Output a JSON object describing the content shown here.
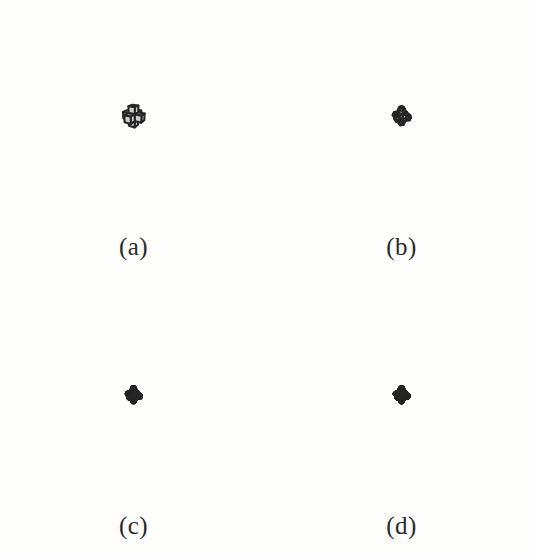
{
  "figure": {
    "kind": "catmull-clark-subdivision-sequence",
    "background_color": "#fdfdfc",
    "surface_fill_color": "#cfcfcf",
    "surface_fill_color_dark": "#c8c8c8",
    "edge_color": "#262626",
    "label_color": "#2a2a2a",
    "panels": [
      {
        "id": "a",
        "label": "(a)",
        "caption_text": "(a)",
        "subdivision_level": 0,
        "description": "control polycube, six-armed cross of cubes",
        "edge_width": 2.1,
        "fill": "#cfcfcf",
        "scale": 1.0
      },
      {
        "id": "b",
        "label": "(b)",
        "caption_text": "(b)",
        "subdivision_level": 1,
        "description": "one Catmull-Clark subdivision step",
        "edge_width": 2.0,
        "fill": "#cfcfcf",
        "scale": 0.98
      },
      {
        "id": "c",
        "label": "(c)",
        "caption_text": "(c)",
        "subdivision_level": 3,
        "description": "three Catmull-Clark subdivision steps",
        "edge_width": 1.15,
        "fill": "#cfcfcf",
        "scale": 0.96
      },
      {
        "id": "d",
        "label": "(d)",
        "caption_text": "(d)",
        "subdivision_level": 4,
        "description": "four Catmull-Clark subdivision steps, limit surface",
        "edge_width": 0.85,
        "fill": "#c8c8c8",
        "scale": 0.96
      }
    ],
    "camera": {
      "yaw_degrees": -31,
      "pitch_degrees": 21,
      "roll_degrees": 0,
      "distance": 11.5,
      "focal_length": 3.05,
      "center_x": 133.5,
      "center_y": 116
    },
    "shape": {
      "type": "polycube-cross",
      "arm_count": 6,
      "cube_size": 1
    }
  }
}
